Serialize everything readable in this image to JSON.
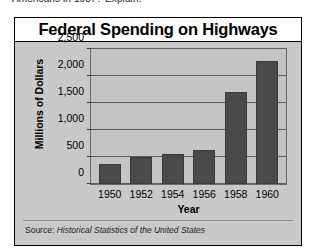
{
  "page": {
    "cropped_text_above_figure": "Americans in 1957? Explain."
  },
  "figure": {
    "title": "Federal Spending on Highways",
    "source_label": "Source:",
    "source_title": "Historical Statistics of the United States"
  },
  "chart_data": {
    "type": "bar",
    "title": "Federal Spending on Highways",
    "xlabel": "Year",
    "ylabel": "Millions of Dollars",
    "categories": [
      "1950",
      "1952",
      "1954",
      "1956",
      "1958",
      "1960"
    ],
    "values": [
      360,
      500,
      545,
      620,
      1680,
      2250
    ],
    "ylim": [
      0,
      2500
    ],
    "ytick_values": [
      0,
      500,
      1000,
      1500,
      2000,
      2500
    ],
    "ytick_labels": [
      "0",
      "500",
      "1,000",
      "1,500",
      "2,000",
      "2,500"
    ],
    "grid": true,
    "legend": "none",
    "bar_color": "#4a4a4a",
    "plot_background": "#c4c4c4",
    "figure_background": "#c9c9c9"
  }
}
